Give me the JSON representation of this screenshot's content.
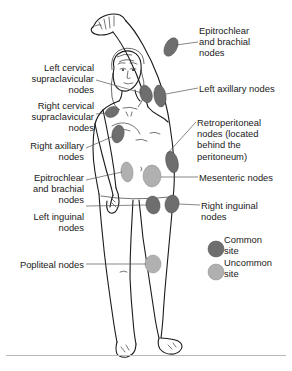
{
  "diagram": {
    "colors": {
      "common_site": "#6e6e6e",
      "uncommon_site": "#b0b0b0",
      "outline": "#1a1a1a",
      "leader_line": "#555555",
      "background": "#ffffff",
      "rule": "#b9b9b9"
    }
  },
  "labels": {
    "left": [
      {
        "id": "left-cervical-supraclavicular",
        "text": "Left cervical\nsupraclavicular\nnodes",
        "align": "right"
      },
      {
        "id": "right-cervical-supraclavicular",
        "text": "Right cervical\nsupraclavicular\nnodes",
        "align": "right"
      },
      {
        "id": "right-axillary",
        "text": "Right axillary\nnodes",
        "align": "right"
      },
      {
        "id": "epitrochlear-brachial-left-side",
        "text": "Epitrochlear\nand brachial\nnodes",
        "align": "right"
      },
      {
        "id": "left-inguinal",
        "text": "Left inguinal\nnodes",
        "align": "right"
      },
      {
        "id": "popliteal",
        "text": "Popliteal nodes",
        "align": "right"
      }
    ],
    "right": [
      {
        "id": "epitrochlear-brachial-right-side",
        "text": "Epitrochlear\nand brachial\nnodes",
        "align": "left"
      },
      {
        "id": "left-axillary",
        "text": "Left axillary nodes",
        "align": "left"
      },
      {
        "id": "retroperitoneal",
        "text": "Retroperitoneal\nnodes (located\nbehind the\nperitoneum)",
        "align": "left"
      },
      {
        "id": "mesenteric",
        "text": "Mesenteric nodes",
        "align": "left"
      },
      {
        "id": "right-inguinal",
        "text": "Right inguinal\nnodes",
        "align": "left"
      }
    ]
  },
  "legend": {
    "items": [
      {
        "id": "common",
        "text": "Common\nsite",
        "swatch": "common-site-dot"
      },
      {
        "id": "uncommon",
        "text": "Uncommon\nsite",
        "swatch": "uncommon-site-dot"
      }
    ]
  },
  "nodes": [
    {
      "id": "left-cervical-node",
      "type": "common"
    },
    {
      "id": "right-cervical-node",
      "type": "common"
    },
    {
      "id": "left-axillary-node",
      "type": "common"
    },
    {
      "id": "right-axillary-node",
      "type": "common"
    },
    {
      "id": "left-epitrochlear-node",
      "type": "common"
    },
    {
      "id": "right-epitrochlear-node",
      "type": "uncommon"
    },
    {
      "id": "retroperitoneal-node",
      "type": "common"
    },
    {
      "id": "mesenteric-node",
      "type": "uncommon"
    },
    {
      "id": "left-inguinal-node",
      "type": "common"
    },
    {
      "id": "right-inguinal-node",
      "type": "common"
    },
    {
      "id": "popliteal-node",
      "type": "uncommon"
    }
  ]
}
